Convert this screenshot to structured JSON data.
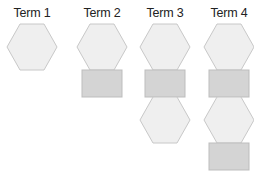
{
  "colors": {
    "hexagon_fill": "#efefef",
    "hexagon_stroke": "#c8c8c8",
    "square_fill": "#d4d4d4",
    "square_stroke": "#bdbdbd",
    "label": "#222222"
  },
  "terms": [
    {
      "label": "Term 1",
      "cx": 32,
      "shapes": [
        "hexagon"
      ]
    },
    {
      "label": "Term 2",
      "cx": 102,
      "shapes": [
        "hexagon",
        "square"
      ]
    },
    {
      "label": "Term 3",
      "cx": 165,
      "shapes": [
        "hexagon",
        "square",
        "hexagon"
      ]
    },
    {
      "label": "Term 4",
      "cx": 229,
      "shapes": [
        "hexagon",
        "square",
        "hexagon",
        "square"
      ]
    }
  ]
}
